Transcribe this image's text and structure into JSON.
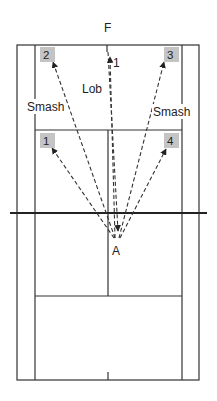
{
  "diagram": {
    "type": "badminton-court-shot-diagram",
    "top_label": "F",
    "player_label": "A",
    "shot_labels": {
      "lob": "Lob",
      "smash_left": "Smash",
      "smash_right": "Smash"
    },
    "target_zones": [
      {
        "id": "1",
        "label": "1",
        "position": "front-left"
      },
      {
        "id": "2",
        "label": "2",
        "position": "back-left"
      },
      {
        "id": "3",
        "label": "3",
        "position": "back-right"
      },
      {
        "id": "4",
        "label": "4",
        "position": "front-right"
      }
    ],
    "incoming_target_label": "1",
    "colors": {
      "lines": "#333333",
      "zone_fill": "#c4c4c4",
      "background": "#ffffff"
    }
  }
}
